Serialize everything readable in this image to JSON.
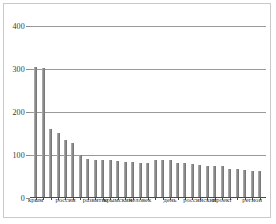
{
  "chart_data": {
    "type": "bar",
    "title": "",
    "subtitle": "",
    "xlabel": "",
    "ylabel": "",
    "ylim": [
      0,
      400
    ],
    "yticks": [
      0,
      100,
      200,
      300,
      400
    ],
    "ytick_labels": [
      "0",
      "100",
      "200",
      "300",
      "400"
    ],
    "grid": true,
    "legend": false,
    "legend_position": "none",
    "bar_color": "#8e8e8e",
    "grid_color": "#9a9a9a",
    "axis_color": "#4a4a4a",
    "categories": [
      "крым",
      "",
      "россии",
      "",
      "развитие",
      "крымский",
      "человек",
      "",
      "",
      "",
      "день",
      "",
      "российский",
      "проект",
      "",
      "регион",
      "",
      "",
      "",
      "",
      "",
      "",
      "",
      "",
      "",
      "",
      "",
      "",
      "",
      "",
      ""
    ],
    "visible_tick_labels": [
      {
        "index": 0,
        "label": "крым"
      },
      {
        "index": 4,
        "label": "россии"
      },
      {
        "index": 8,
        "label": "развитие"
      },
      {
        "index": 11,
        "label": "крымский"
      },
      {
        "index": 14,
        "label": "человек"
      },
      {
        "index": 18,
        "label": "день"
      },
      {
        "index": 22,
        "label": "российский"
      },
      {
        "index": 25,
        "label": "проект"
      },
      {
        "index": 29,
        "label": "регион"
      }
    ],
    "values": [
      303,
      300,
      158,
      150,
      133,
      126,
      98,
      88,
      87,
      86,
      85,
      83,
      82,
      81,
      80,
      79,
      86,
      86,
      86,
      80,
      78,
      76,
      74,
      73,
      72,
      71,
      66,
      64,
      62,
      61,
      60
    ],
    "n_bars": 31
  }
}
